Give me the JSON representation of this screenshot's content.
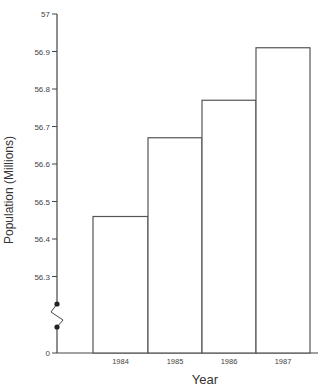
{
  "chart_data": {
    "type": "bar",
    "title": "",
    "xlabel": "Year",
    "ylabel": "Population (Millions)",
    "categories": [
      "1984",
      "1985",
      "1986",
      "1987"
    ],
    "values": [
      56.46,
      56.67,
      56.77,
      56.91
    ],
    "y_ticks": [
      "0",
      "56.3",
      "56.4",
      "56.5",
      "56.6",
      "56.7",
      "56.8",
      "56.9",
      "57"
    ],
    "ylim": [
      56.2,
      57.0
    ],
    "axis_break": true,
    "grid": false,
    "legend": null,
    "bar_fill": "#ffffff",
    "bar_stroke": "#555555"
  }
}
